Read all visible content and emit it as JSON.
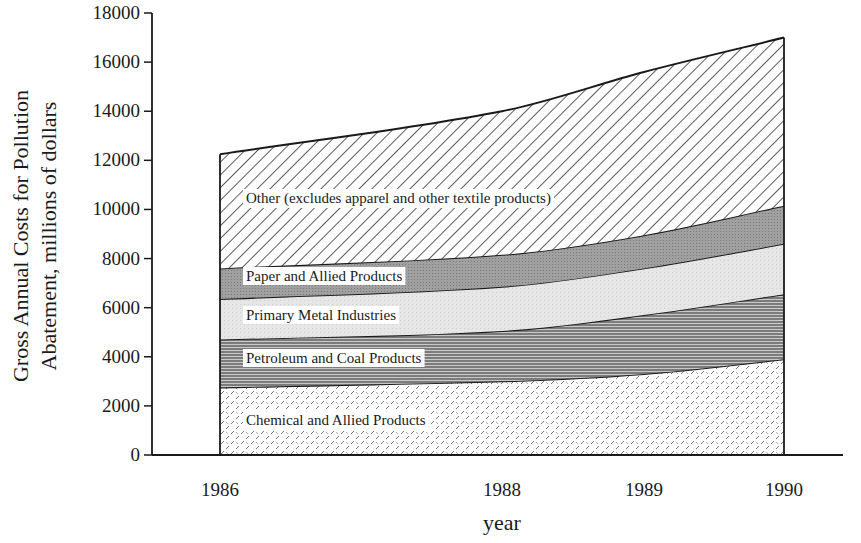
{
  "chart_data": {
    "type": "area",
    "stacked": true,
    "title": "",
    "xlabel": "year",
    "ylabel_lines": [
      "Gross Annual Costs for Pollution",
      "Abatement, millions of dollars"
    ],
    "ylabel": "Gross Annual Costs for Pollution Abatement, millions of dollars",
    "x": [
      1986,
      1988,
      1989,
      1990
    ],
    "x_tick_labels": [
      "1986",
      "1988",
      "1989",
      "1990"
    ],
    "y_ticks": [
      0,
      2000,
      4000,
      6000,
      8000,
      10000,
      12000,
      14000,
      16000,
      18000
    ],
    "y_tick_labels": [
      "0",
      "2000",
      "4000",
      "6000",
      "8000",
      "10000",
      "12000",
      "14000",
      "16000",
      "18000"
    ],
    "ylim": [
      0,
      18000
    ],
    "grid": false,
    "legend": "inline labels",
    "series": [
      {
        "name": "Chemical and Allied Products",
        "pattern": "dashes",
        "values": [
          2750,
          3000,
          3300,
          3900
        ],
        "cumulative_top": [
          2750,
          3000,
          3300,
          3900
        ]
      },
      {
        "name": "Petroleum and Coal Products",
        "pattern": "horizontal-lines",
        "values": [
          1950,
          2050,
          2400,
          2650
        ],
        "cumulative_top": [
          4700,
          5050,
          5700,
          6550
        ]
      },
      {
        "name": "Primary Metal Industries",
        "pattern": "light-gray",
        "values": [
          1650,
          1800,
          1900,
          2050
        ],
        "cumulative_top": [
          6350,
          6850,
          7600,
          8600
        ]
      },
      {
        "name": "Paper and Allied Products",
        "pattern": "dark-gray",
        "values": [
          1250,
          1300,
          1350,
          1550
        ],
        "cumulative_top": [
          7600,
          8150,
          8950,
          10150
        ]
      },
      {
        "name": "Other (excludes apparel and other textile products)",
        "pattern": "diagonal-hatch",
        "values": [
          4650,
          5850,
          6650,
          6850
        ],
        "cumulative_top": [
          12250,
          14000,
          15600,
          17000
        ]
      }
    ],
    "series_label_positions": [
      {
        "x": 243,
        "y": 425
      },
      {
        "x": 243,
        "y": 363
      },
      {
        "x": 243,
        "y": 320
      },
      {
        "x": 243,
        "y": 281
      },
      {
        "x": 243,
        "y": 203
      }
    ]
  },
  "layout": {
    "plot_left_px": 152,
    "x_axis_end_px": 843,
    "y0_px": 455,
    "y_top_px": 13,
    "x_px": [
      220,
      502,
      644,
      784
    ],
    "colors": {
      "ink": "#1a1a1a",
      "paper_fill": "#9a9a9a",
      "metal_fill": "#e4e4e4",
      "petroleum_line": "#555555",
      "chemical_mark": "#6a6a6a"
    }
  }
}
